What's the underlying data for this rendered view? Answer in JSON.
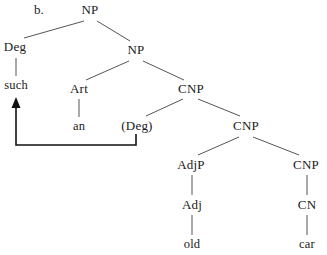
{
  "figure": {
    "label": "b.",
    "label_x": 34,
    "label_y": 3,
    "width": 327,
    "height": 255,
    "line_color": "#555555",
    "text_color": "#1a1a1a",
    "arrow_color": "#111111",
    "background": "#ffffff"
  },
  "nodes": [
    {
      "id": "np-top",
      "text": "NP",
      "x": 90,
      "y": 3,
      "kind": "category"
    },
    {
      "id": "deg",
      "text": "Deg",
      "x": 15,
      "y": 40,
      "kind": "category"
    },
    {
      "id": "np-2",
      "text": "NP",
      "x": 136,
      "y": 43,
      "kind": "category"
    },
    {
      "id": "such",
      "text": "such",
      "x": 16,
      "y": 79,
      "kind": "terminal"
    },
    {
      "id": "art",
      "text": "Art",
      "x": 79,
      "y": 82,
      "kind": "category"
    },
    {
      "id": "cnp-1",
      "text": "CNP",
      "x": 191,
      "y": 82,
      "kind": "category"
    },
    {
      "id": "an",
      "text": "an",
      "x": 79,
      "y": 120,
      "kind": "terminal"
    },
    {
      "id": "deg-trace",
      "text": "(Deg)",
      "x": 137,
      "y": 119,
      "kind": "category"
    },
    {
      "id": "cnp-2",
      "text": "CNP",
      "x": 246,
      "y": 119,
      "kind": "category"
    },
    {
      "id": "adjp",
      "text": "AdjP",
      "x": 191,
      "y": 158,
      "kind": "category"
    },
    {
      "id": "cnp-3",
      "text": "CNP",
      "x": 306,
      "y": 158,
      "kind": "category"
    },
    {
      "id": "adj",
      "text": "Adj",
      "x": 192,
      "y": 198,
      "kind": "category"
    },
    {
      "id": "cn",
      "text": "CN",
      "x": 307,
      "y": 198,
      "kind": "category"
    },
    {
      "id": "old",
      "text": "old",
      "x": 192,
      "y": 238,
      "kind": "terminal"
    },
    {
      "id": "car",
      "text": "car",
      "x": 307,
      "y": 238,
      "kind": "terminal"
    }
  ],
  "branches": [
    {
      "from": "np-top",
      "to": "deg",
      "x1": 84,
      "y1": 21,
      "x2": 24,
      "y2": 38
    },
    {
      "from": "np-top",
      "to": "np-2",
      "x1": 97,
      "y1": 21,
      "x2": 130,
      "y2": 41
    },
    {
      "from": "deg",
      "to": "such",
      "x1": 16,
      "y1": 58,
      "x2": 16,
      "y2": 76
    },
    {
      "from": "np-2",
      "to": "art",
      "x1": 129,
      "y1": 61,
      "x2": 86,
      "y2": 80
    },
    {
      "from": "np-2",
      "to": "cnp-1",
      "x1": 143,
      "y1": 61,
      "x2": 184,
      "y2": 80
    },
    {
      "from": "art",
      "to": "an",
      "x1": 79,
      "y1": 99,
      "x2": 79,
      "y2": 117
    },
    {
      "from": "cnp-1",
      "to": "deg-trace",
      "x1": 183,
      "y1": 99,
      "x2": 146,
      "y2": 116
    },
    {
      "from": "cnp-1",
      "to": "cnp-2",
      "x1": 198,
      "y1": 99,
      "x2": 240,
      "y2": 116
    },
    {
      "from": "cnp-2",
      "to": "adjp",
      "x1": 239,
      "y1": 137,
      "x2": 198,
      "y2": 155
    },
    {
      "from": "cnp-2",
      "to": "cnp-3",
      "x1": 253,
      "y1": 137,
      "x2": 299,
      "y2": 155
    },
    {
      "from": "adjp",
      "to": "adj",
      "x1": 192,
      "y1": 175,
      "x2": 192,
      "y2": 195
    },
    {
      "from": "cnp-3",
      "to": "cn",
      "x1": 307,
      "y1": 175,
      "x2": 307,
      "y2": 195
    },
    {
      "from": "adj",
      "to": "old",
      "x1": 192,
      "y1": 215,
      "x2": 192,
      "y2": 235
    },
    {
      "from": "cn",
      "to": "car",
      "x1": 307,
      "y1": 215,
      "x2": 307,
      "y2": 235
    }
  ],
  "movement": {
    "description": "movement-arrow-deg-to-such",
    "from_node": "deg-trace",
    "to_node": "such",
    "path": "M 136 134 L 136 145 L 16 145 L 16 106",
    "arrow_tip_x": 16,
    "arrow_tip_y": 97,
    "arrow_half_width": 4.5,
    "arrow_height": 11,
    "stroke_width": 1.6
  }
}
